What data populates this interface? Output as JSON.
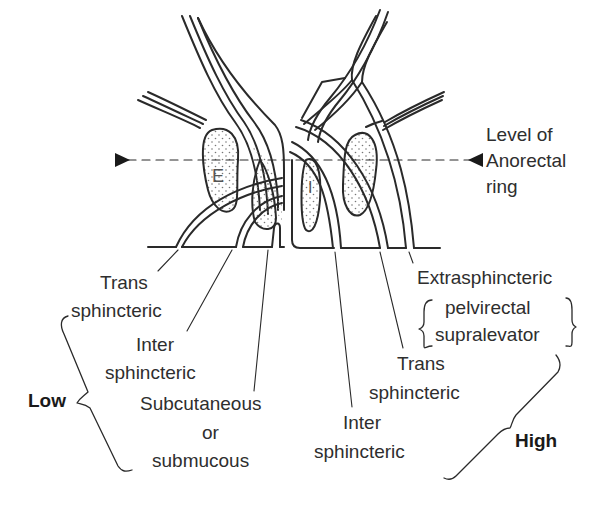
{
  "diagram": {
    "anatomy_labels": {
      "external_sphincter": "E",
      "internal_sphincter": "I"
    },
    "level_marker": {
      "line1": "Level of",
      "line2": "Anorectal",
      "line3": "ring"
    },
    "low_group": {
      "label": "Low",
      "items": [
        {
          "line1": "Trans",
          "line2": "sphincteric"
        },
        {
          "line1": "Inter",
          "line2": "sphincteric"
        },
        {
          "line1": "Subcutaneous",
          "line2": "or",
          "line3": "submucous"
        }
      ]
    },
    "high_group": {
      "label": "High",
      "items": [
        {
          "line1": "Extrasphincteric",
          "line2": "pelvirectal",
          "line3": "supralevator"
        },
        {
          "line1": "Trans",
          "line2": "sphincteric"
        },
        {
          "line1": "Inter",
          "line2": "sphincteric"
        }
      ]
    },
    "colors": {
      "line": "#2a2a2a",
      "text": "#2e2e2e",
      "dot_fill": "#777777"
    }
  }
}
